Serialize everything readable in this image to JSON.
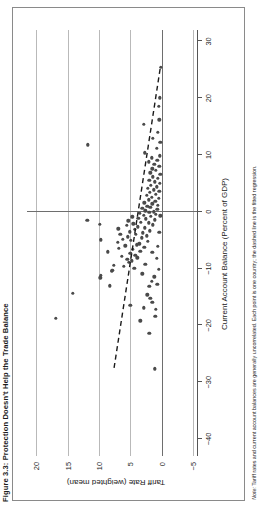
{
  "figure": {
    "title": "Figure 3.3: Protection Doesn't Help the Trade Balance",
    "note_label": "Note:",
    "note_text": "Tariff rates and current account balances are generally uncorrelated. Each point is one country; the dashed line is the fitted regression.",
    "colors": {
      "point": "#4a4a4a",
      "grid": "#b9b9b9",
      "zero_line": "#6e6e6e",
      "axis": "#555555",
      "frame": "#8a8a8a",
      "background": "#ffffff",
      "trend": "#1a1a1a"
    }
  },
  "chart_data": {
    "type": "scatter",
    "title": "Figure 3.3: Protection Doesn't Help the Trade Balance",
    "xlabel": "Current Account Balance (Percent of GDP)",
    "ylabel": "Tariff Rate (weighted mean)",
    "xlim": [
      -43,
      32
    ],
    "ylim": [
      -5.8,
      21.5
    ],
    "xticks": [
      -40,
      -30,
      -20,
      -10,
      0,
      10,
      20,
      30
    ],
    "xtick_labels": [
      "−40",
      "−30",
      "−20",
      "−10",
      "0",
      "10",
      "20",
      "30"
    ],
    "yticks": [
      -5,
      0,
      5,
      10,
      15,
      20
    ],
    "ytick_labels": [
      "−5",
      "0",
      "5",
      "10",
      "15",
      "20"
    ],
    "grid": "horizontal gridlines at each tariff tick",
    "legend": null,
    "zero_reference_lines": {
      "x": 0,
      "y": 0
    },
    "trendline": {
      "style": "dashed",
      "x_start": -27.5,
      "y_start": 7.6,
      "x_end": 25.5,
      "y_end": 0.2
    },
    "points": [
      [
        -18.4,
        1.0
      ],
      [
        -16.9,
        2.9
      ],
      [
        -15.2,
        1.8
      ],
      [
        -14.6,
        2.3
      ],
      [
        -13.1,
        2.0
      ],
      [
        -12.2,
        1.6
      ],
      [
        -11.4,
        1.2
      ],
      [
        -10.9,
        3.1
      ],
      [
        -10.5,
        8.0
      ],
      [
        -10.3,
        7.9
      ],
      [
        -9.9,
        4.4
      ],
      [
        -9.6,
        6.0
      ],
      [
        -9.2,
        2.6
      ],
      [
        -8.9,
        5.2
      ],
      [
        -8.6,
        4.8
      ],
      [
        -8.4,
        5.5
      ],
      [
        -8.1,
        3.9
      ],
      [
        -7.8,
        6.4
      ],
      [
        -7.6,
        4.2
      ],
      [
        -7.3,
        5.0
      ],
      [
        -7.1,
        1.5
      ],
      [
        -6.9,
        3.4
      ],
      [
        -6.6,
        4.6
      ],
      [
        -6.4,
        6.8
      ],
      [
        -6.2,
        2.8
      ],
      [
        -6.0,
        5.8
      ],
      [
        -5.8,
        4.0
      ],
      [
        -5.6,
        3.6
      ],
      [
        -5.4,
        7.0
      ],
      [
        -5.2,
        2.2
      ],
      [
        -5.0,
        4.9
      ],
      [
        -4.8,
        6.2
      ],
      [
        -4.6,
        3.2
      ],
      [
        -4.4,
        5.4
      ],
      [
        -4.2,
        2.4
      ],
      [
        -4.0,
        4.1
      ],
      [
        -3.9,
        6.6
      ],
      [
        -3.7,
        3.0
      ],
      [
        -3.5,
        5.1
      ],
      [
        -3.3,
        1.9
      ],
      [
        -3.1,
        4.3
      ],
      [
        -3.0,
        6.9
      ],
      [
        -2.8,
        2.7
      ],
      [
        -2.6,
        3.8
      ],
      [
        -2.4,
        5.6
      ],
      [
        -2.3,
        1.4
      ],
      [
        -2.1,
        4.5
      ],
      [
        -1.9,
        2.1
      ],
      [
        -1.8,
        3.3
      ],
      [
        -1.6,
        5.3
      ],
      [
        -1.4,
        1.1
      ],
      [
        -1.2,
        2.5
      ],
      [
        -1.1,
        3.7
      ],
      [
        -0.9,
        4.7
      ],
      [
        -0.8,
        1.7
      ],
      [
        -0.6,
        2.9
      ],
      [
        -0.4,
        0.9
      ],
      [
        -0.3,
        3.5
      ],
      [
        -0.1,
        2.0
      ],
      [
        0.0,
        1.3
      ],
      [
        0.2,
        2.6
      ],
      [
        0.4,
        0.7
      ],
      [
        0.6,
        3.1
      ],
      [
        0.8,
        1.8
      ],
      [
        1.0,
        2.3
      ],
      [
        1.2,
        0.6
      ],
      [
        1.4,
        1.5
      ],
      [
        1.6,
        2.8
      ],
      [
        1.9,
        1.0
      ],
      [
        2.1,
        2.1
      ],
      [
        2.4,
        0.5
      ],
      [
        2.6,
        1.6
      ],
      [
        2.9,
        2.4
      ],
      [
        3.1,
        0.9
      ],
      [
        3.4,
        1.9
      ],
      [
        3.6,
        0.4
      ],
      [
        3.9,
        1.3
      ],
      [
        4.1,
        2.2
      ],
      [
        4.4,
        0.8
      ],
      [
        4.7,
        1.7
      ],
      [
        5.0,
        0.3
      ],
      [
        5.3,
        1.1
      ],
      [
        5.6,
        2.0
      ],
      [
        5.9,
        0.6
      ],
      [
        6.2,
        1.4
      ],
      [
        6.6,
        0.2
      ],
      [
        6.9,
        1.8
      ],
      [
        7.3,
        0.9
      ],
      [
        7.6,
        1.5
      ],
      [
        8.0,
        0.4
      ],
      [
        8.4,
        1.2
      ],
      [
        8.8,
        2.1
      ],
      [
        9.1,
        0.7
      ],
      [
        9.5,
        1.6
      ],
      [
        9.9,
        0.3
      ],
      [
        10.4,
        2.7
      ],
      [
        11.2,
        0.8
      ],
      [
        11.8,
        11.8
      ],
      [
        12.2,
        0.2
      ],
      [
        12.9,
        1.4
      ],
      [
        14.0,
        0.6
      ],
      [
        15.4,
        2.9
      ],
      [
        16.2,
        0.4
      ],
      [
        18.6,
        0.5
      ],
      [
        20.1,
        0.3
      ],
      [
        25.4,
        0.1
      ],
      [
        -1.5,
        11.9
      ],
      [
        -14.3,
        14.2
      ],
      [
        -18.7,
        16.9
      ],
      [
        -11.6,
        9.8
      ],
      [
        -11.2,
        9.7
      ],
      [
        -13.0,
        8.3
      ],
      [
        -9.4,
        7.6
      ],
      [
        -7.0,
        8.6
      ],
      [
        -4.9,
        9.7
      ],
      [
        -2.2,
        9.9
      ],
      [
        -16.4,
        5.0
      ],
      [
        -19.2,
        3.4
      ],
      [
        -21.4,
        2.0
      ],
      [
        -27.6,
        1.1
      ],
      [
        -15.9,
        1.5
      ],
      [
        -17.2,
        0.9
      ],
      [
        -12.7,
        0.7
      ],
      [
        -10.1,
        0.5
      ],
      [
        -8.2,
        0.8
      ],
      [
        -6.1,
        0.6
      ],
      [
        -3.6,
        0.4
      ],
      [
        -0.7,
        0.2
      ]
    ]
  }
}
